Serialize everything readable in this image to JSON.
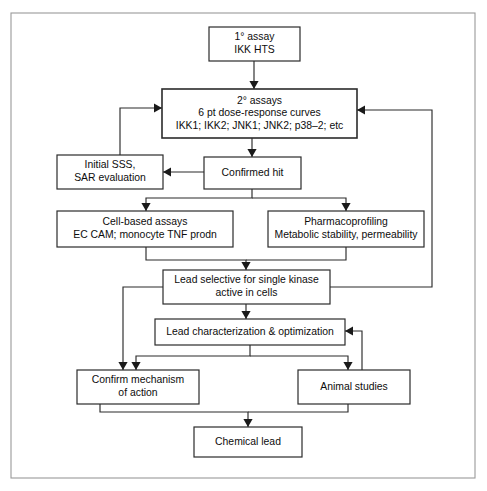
{
  "diagram": {
    "background_color": "#ffffff",
    "line_color": "#2b2b2b",
    "text_color": "#0d0d0d",
    "frame_color": "#9a9a9a",
    "nodes": [
      {
        "id": "primary-assay",
        "name": "node-primary-assay",
        "lines": [
          "1° assay",
          "IKK HTS"
        ],
        "x": 209,
        "y": 27,
        "w": 91,
        "h": 34
      },
      {
        "id": "secondary-assays",
        "name": "node-secondary-assays",
        "lines": [
          "2° assays",
          "6 pt dose-response curves",
          "IKK1; IKK2; JNK1; JNK2; p38–2; etc"
        ],
        "x": 162,
        "y": 89,
        "w": 195,
        "h": 49
      },
      {
        "id": "initial-sss",
        "name": "node-initial-sss-sar-evaluation",
        "lines": [
          "Initial SSS,",
          "SAR evaluation"
        ],
        "x": 57,
        "y": 155,
        "w": 106,
        "h": 34
      },
      {
        "id": "confirmed-hit",
        "name": "node-confirmed-hit",
        "lines": [
          "Confirmed hit"
        ],
        "x": 204,
        "y": 157,
        "w": 97,
        "h": 32
      },
      {
        "id": "cell-based-assays",
        "name": "node-cell-based-assays",
        "lines": [
          "Cell-based assays",
          "EC CAM; monocyte TNF prodn"
        ],
        "x": 57,
        "y": 211,
        "w": 176,
        "h": 36
      },
      {
        "id": "pharmacoprofiling",
        "name": "node-pharmacoprofiling",
        "lines": [
          "Pharmacoprofiling",
          "Metabolic stability, permeability"
        ],
        "x": 268,
        "y": 211,
        "w": 156,
        "h": 36
      },
      {
        "id": "lead-selective",
        "name": "node-lead-selective-single-kinase",
        "lines": [
          "Lead selective for single kinase",
          "active in cells"
        ],
        "x": 163,
        "y": 270,
        "w": 167,
        "h": 34
      },
      {
        "id": "lead-characterization",
        "name": "node-lead-characterization-optimization",
        "lines": [
          "Lead characterization & optimization"
        ],
        "x": 155,
        "y": 319,
        "w": 190,
        "h": 26
      },
      {
        "id": "confirm-mechanism",
        "name": "node-confirm-mechanism-of-action",
        "lines": [
          "Confirm mechanism",
          "of action"
        ],
        "x": 77,
        "y": 370,
        "w": 122,
        "h": 34
      },
      {
        "id": "animal-studies",
        "name": "node-animal-studies",
        "lines": [
          "Animal studies"
        ],
        "x": 298,
        "y": 370,
        "w": 112,
        "h": 34
      },
      {
        "id": "chemical-lead",
        "name": "node-chemical-lead",
        "lines": [
          "Chemical lead"
        ],
        "x": 194,
        "y": 427,
        "w": 108,
        "h": 30
      }
    ],
    "connectors": [
      {
        "id": "primary-to-secondary",
        "name": "connector-primary-assay-to-secondary-assays",
        "points": "254,61 254,89",
        "arrow": {
          "x": 254,
          "y": 89,
          "dir": "down"
        }
      },
      {
        "id": "secondary-to-confirmed",
        "name": "connector-secondary-assays-to-confirmed-hit",
        "points": "252,138 252,157",
        "arrow": {
          "x": 252,
          "y": 157,
          "dir": "down"
        }
      },
      {
        "id": "confirmed-to-initial-sss",
        "name": "connector-confirmed-hit-to-initial-sss",
        "points": "204,172 163,172",
        "arrow": {
          "x": 163,
          "y": 172,
          "dir": "left"
        }
      },
      {
        "id": "initial-sss-feedback",
        "name": "connector-initial-sss-feedback-to-secondary-assays",
        "points": "120,155 120,108 162,108",
        "arrow": {
          "x": 162,
          "y": 108,
          "dir": "right"
        }
      },
      {
        "id": "confirmed-bus",
        "name": "connector-confirmed-hit-split-bus",
        "points": "252,189 252,198 146,198 146,211",
        "arrow": {
          "x": 146,
          "y": 211,
          "dir": "down"
        }
      },
      {
        "id": "confirmed-bus-right",
        "name": "connector-confirmed-hit-to-pharmacoprofiling",
        "points": "252,198 346,198 346,211",
        "arrow": {
          "x": 346,
          "y": 211,
          "dir": "down"
        }
      },
      {
        "id": "cell-to-lead-selective",
        "name": "connector-cell-based-assays-to-lead-selective",
        "points": "146,247 146,260 246,260 246,270",
        "arrow": {
          "x": 246,
          "y": 270,
          "dir": "down"
        }
      },
      {
        "id": "pharmaco-to-lead-selective",
        "name": "connector-pharmacoprofiling-to-lead-selective",
        "points": "346,247 346,260 246,260",
        "arrow": null
      },
      {
        "id": "lead-selective-right-feedback",
        "name": "connector-lead-selective-feedback-to-secondary-assays",
        "points": "330,287 432,287 432,110 357,110",
        "arrow": {
          "x": 357,
          "y": 110,
          "dir": "left"
        }
      },
      {
        "id": "lead-selective-left-to-confirm",
        "name": "connector-lead-selective-to-confirm-mechanism",
        "points": "163,287 123,287 123,370",
        "arrow": {
          "x": 123,
          "y": 370,
          "dir": "down"
        }
      },
      {
        "id": "lead-selective-to-lead-char",
        "name": "connector-lead-selective-to-lead-characterization",
        "points": "246,304 246,319",
        "arrow": {
          "x": 246,
          "y": 319,
          "dir": "down"
        }
      },
      {
        "id": "lead-char-bus",
        "name": "connector-lead-characterization-split-bus",
        "points": "250,345 250,356 136,356 136,370",
        "arrow": {
          "x": 136,
          "y": 370,
          "dir": "down"
        }
      },
      {
        "id": "lead-char-bus-right",
        "name": "connector-lead-characterization-to-animal-studies",
        "points": "250,356 348,356 348,370",
        "arrow": {
          "x": 348,
          "y": 370,
          "dir": "down"
        }
      },
      {
        "id": "animal-feedback",
        "name": "connector-animal-studies-feedback-to-lead-characterization",
        "points": "410,387 362,387 362,331 345,331",
        "arrow": {
          "x": 345,
          "y": 331,
          "dir": "left"
        }
      },
      {
        "id": "confirm-to-chemical-lead",
        "name": "connector-confirm-mechanism-to-chemical-lead",
        "points": "100,404 100,412 248,412 248,427",
        "arrow": {
          "x": 248,
          "y": 427,
          "dir": "down"
        }
      },
      {
        "id": "animal-to-chemical-lead",
        "name": "connector-animal-studies-to-chemical-lead",
        "points": "348,404 348,412 248,412",
        "arrow": null
      }
    ],
    "frame": {
      "name": "page-frame-border",
      "x": 11,
      "y": 13,
      "w": 464,
      "h": 465
    }
  }
}
